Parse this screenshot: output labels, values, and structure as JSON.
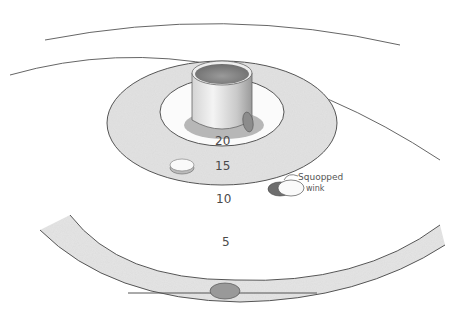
{
  "diagram": {
    "rings": [
      {
        "score": "20",
        "label": "20"
      },
      {
        "score": "15",
        "label": "15"
      },
      {
        "score": "10",
        "label": "10"
      },
      {
        "score": "5",
        "label": "5"
      }
    ],
    "annotation": {
      "line1": "Squopped",
      "line2": "wink"
    },
    "objects": [
      {
        "name": "pot",
        "description": "cylindrical cup at center"
      },
      {
        "name": "wink-on-pot",
        "description": "wink leaning against pot side"
      },
      {
        "name": "wink-in-15",
        "description": "white wink in 15 ring"
      },
      {
        "name": "squopped-wink",
        "description": "wink covered by another wink in 10 ring"
      },
      {
        "name": "wink-on-line",
        "description": "side view of wink on baseline"
      }
    ],
    "colors": {
      "ring_shade": "#e6e6e6",
      "line": "#555555",
      "pot_dark": "#7a7a7a",
      "background": "#ffffff"
    }
  }
}
